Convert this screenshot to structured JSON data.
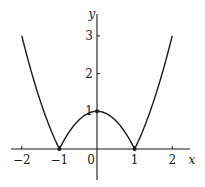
{
  "chart_data": {
    "type": "line",
    "title": "",
    "function": "y = |x^2 - 1|",
    "xlabel": "x",
    "ylabel": "y",
    "xlim": [
      -2.2,
      2.35
    ],
    "ylim": [
      -1.05,
      3.9
    ],
    "grid": false,
    "legend": null,
    "x_ticks": [
      -2,
      -1,
      0,
      1,
      2
    ],
    "x_tick_labels": [
      "−2",
      "−1",
      "0",
      "1",
      "2"
    ],
    "y_ticks": [
      1,
      2,
      3
    ],
    "y_tick_labels": [
      "1",
      "2",
      "3"
    ],
    "series": [
      {
        "name": "y = |x² − 1|",
        "x": [
          -2,
          -1.75,
          -1.5,
          -1.25,
          -1,
          -0.75,
          -0.5,
          -0.25,
          0,
          0.25,
          0.5,
          0.75,
          1,
          1.25,
          1.5,
          1.75,
          2
        ],
        "values": [
          3,
          2.0625,
          1.25,
          0.5625,
          0,
          0.4375,
          0.75,
          0.9375,
          1,
          0.9375,
          0.75,
          0.4375,
          0,
          0.5625,
          1.25,
          2.0625,
          3
        ]
      }
    ],
    "marked_points": [
      {
        "x": -1,
        "y": 0
      },
      {
        "x": 0,
        "y": 1
      },
      {
        "x": 1,
        "y": 0
      }
    ],
    "color": "#1a1a1a"
  },
  "axes": {
    "x_label": "x",
    "y_label": "y",
    "origin_label": "0"
  }
}
